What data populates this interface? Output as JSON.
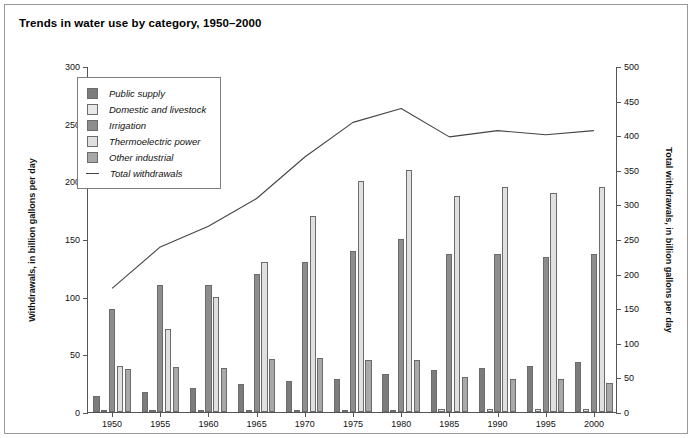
{
  "title": "Trends in water use by category, 1950–2000",
  "axes": {
    "left_label": "Withdrawals, in billion gallons per day",
    "right_label": "Total withdrawals, in billion gallons per day",
    "left_ticks": [
      0,
      50,
      100,
      150,
      200,
      250,
      300
    ],
    "right_ticks": [
      0,
      50,
      100,
      150,
      200,
      250,
      300,
      350,
      400,
      450,
      500
    ]
  },
  "legend": {
    "items": [
      {
        "label": "Public supply",
        "color": "#7c7c7c",
        "type": "swatch"
      },
      {
        "label": "Domestic and livestock",
        "color": "#e8e8e8",
        "type": "swatch"
      },
      {
        "label": "Irrigation",
        "color": "#8d8d8d",
        "type": "swatch"
      },
      {
        "label": "Thermoelectric power",
        "color": "#e0e0e0",
        "type": "swatch"
      },
      {
        "label": "Other industrial",
        "color": "#a8a8a8",
        "type": "swatch"
      },
      {
        "label": "Total withdrawals",
        "color": "#444444",
        "type": "line"
      }
    ]
  },
  "chart_data": {
    "type": "bar",
    "title": "Trends in water use by category, 1950–2000",
    "xlabel": "",
    "ylabel": "Withdrawals, in billion gallons per day",
    "ylabel_right": "Total withdrawals, in billion gallons per day",
    "ylim": [
      0,
      300
    ],
    "ylim_right": [
      0,
      500
    ],
    "grid": false,
    "legend_position": "upper-left-inside",
    "categories": [
      "1950",
      "1955",
      "1960",
      "1965",
      "1970",
      "1975",
      "1980",
      "1985",
      "1990",
      "1995",
      "2000"
    ],
    "series": [
      {
        "name": "Public supply",
        "axis": "left",
        "color": "#7c7c7c",
        "values": [
          14,
          17,
          21,
          24,
          27,
          29,
          33,
          36,
          38,
          40,
          43
        ]
      },
      {
        "name": "Domestic and livestock",
        "axis": "left",
        "color": "#e8e8e8",
        "values": [
          2,
          2,
          2,
          2,
          2,
          2,
          2,
          3,
          3,
          3,
          3
        ]
      },
      {
        "name": "Irrigation",
        "axis": "left",
        "color": "#8d8d8d",
        "values": [
          89,
          110,
          110,
          120,
          130,
          140,
          150,
          137,
          137,
          134,
          137
        ]
      },
      {
        "name": "Thermoelectric power",
        "axis": "left",
        "color": "#e0e0e0",
        "values": [
          40,
          72,
          100,
          130,
          170,
          200,
          210,
          187,
          195,
          190,
          195
        ]
      },
      {
        "name": "Other industrial",
        "axis": "left",
        "color": "#a8a8a8",
        "values": [
          37,
          39,
          38,
          46,
          47,
          45,
          45,
          30,
          29,
          29,
          25
        ]
      }
    ],
    "line_series": {
      "name": "Total withdrawals",
      "axis": "right",
      "color": "#444444",
      "values": [
        180,
        240,
        270,
        310,
        370,
        420,
        440,
        399,
        408,
        402,
        408
      ]
    }
  }
}
